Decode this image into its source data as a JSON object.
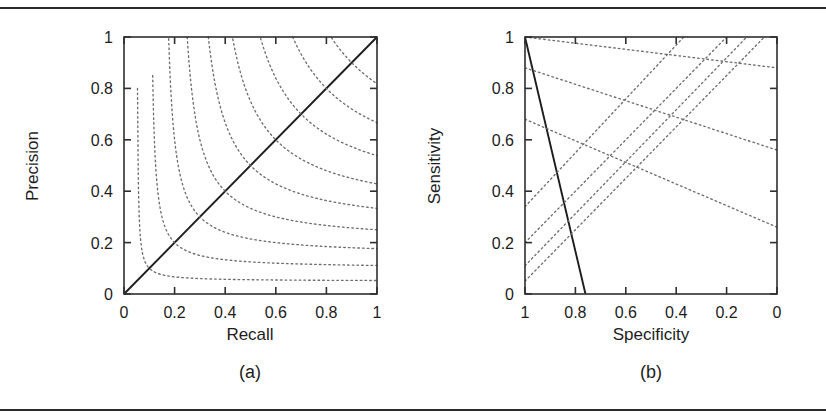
{
  "figure": {
    "background": "#ffffff",
    "rule_color": "#2b2b2b",
    "axis_color": "#2f2f2f",
    "iso_color": "#6e6e6e",
    "solid_color": "#1d1d1d"
  },
  "panels": [
    {
      "id": "a",
      "caption": "(a)",
      "xlabel": "Recall",
      "ylabel": "Precision",
      "xticks": [
        "0",
        "0.2",
        "0.4",
        "0.6",
        "0.8",
        "1"
      ],
      "yticks": [
        "0",
        "0.2",
        "0.4",
        "0.6",
        "0.8",
        "1"
      ]
    },
    {
      "id": "b",
      "caption": "(b)",
      "xlabel": "Specificity",
      "ylabel": "Sensitivity",
      "xticks": [
        "1",
        "0.8",
        "0.6",
        "0.4",
        "0.2",
        "0"
      ],
      "yticks": [
        "0",
        "0.2",
        "0.4",
        "0.6",
        "0.8",
        "1"
      ]
    }
  ],
  "chart_data": [
    {
      "type": "line",
      "panel": "a",
      "title": "(a)",
      "xlabel": "Recall",
      "ylabel": "Precision",
      "xlim": [
        0,
        1
      ],
      "ylim": [
        0,
        1
      ],
      "x_tick_values": [
        0,
        0.2,
        0.4,
        0.6,
        0.8,
        1
      ],
      "y_tick_values": [
        0,
        0.2,
        0.4,
        0.6,
        0.8,
        1
      ],
      "x_reversed": false,
      "grid": false,
      "legend": "none",
      "annotation": "Dotted curves are iso-F-measure contours F = 2PR/(P+R); solid line is the diagonal Precision = Recall.",
      "series": [
        {
          "name": "diagonal Precision = Recall",
          "style": "solid",
          "x": [
            0,
            1
          ],
          "values": [
            0,
            1
          ]
        },
        {
          "name": "iso-F 0.1",
          "style": "dotted",
          "level": 0.1
        },
        {
          "name": "iso-F 0.2",
          "style": "dotted",
          "level": 0.2
        },
        {
          "name": "iso-F 0.3",
          "style": "dotted",
          "level": 0.3
        },
        {
          "name": "iso-F 0.4",
          "style": "dotted",
          "level": 0.4
        },
        {
          "name": "iso-F 0.5",
          "style": "dotted",
          "level": 0.5
        },
        {
          "name": "iso-F 0.6",
          "style": "dotted",
          "level": 0.6
        },
        {
          "name": "iso-F 0.7",
          "style": "dotted",
          "level": 0.7
        },
        {
          "name": "iso-F 0.8",
          "style": "dotted",
          "level": 0.8
        },
        {
          "name": "iso-F 0.9",
          "style": "dotted",
          "level": 0.9
        }
      ]
    },
    {
      "type": "line",
      "panel": "b",
      "title": "(b)",
      "xlabel": "Specificity",
      "ylabel": "Sensitivity",
      "xlim": [
        1,
        0
      ],
      "ylim": [
        0,
        1
      ],
      "x_tick_values": [
        1,
        0.8,
        0.6,
        0.4,
        0.2,
        0
      ],
      "y_tick_values": [
        0,
        0.2,
        0.4,
        0.6,
        0.8,
        1
      ],
      "x_reversed": true,
      "grid": false,
      "legend": "none",
      "annotation": "Dotted straight lines are iso-performance lines fanning out from the top-left corner (Specificity = 1, Sensitivity = 1); the solid line descends from (1, 1) to about (0.76, 0).",
      "series": [
        {
          "name": "solid operating line",
          "style": "solid",
          "x": [
            1,
            0.76
          ],
          "values": [
            1,
            0
          ]
        },
        {
          "name": "iso line 1",
          "style": "dotted",
          "x": [
            1,
            0
          ],
          "values": [
            1.0,
            0.88
          ]
        },
        {
          "name": "iso line 2",
          "style": "dotted",
          "x": [
            1,
            0
          ],
          "values": [
            0.88,
            0.56
          ]
        },
        {
          "name": "iso line 3",
          "style": "dotted",
          "x": [
            1,
            0
          ],
          "values": [
            0.68,
            0.26
          ]
        },
        {
          "name": "iso line 4",
          "style": "dotted",
          "x": [
            1,
            0.37
          ],
          "values": [
            0.34,
            1.0
          ]
        },
        {
          "name": "iso line 5",
          "style": "dotted",
          "x": [
            1,
            0.2
          ],
          "values": [
            0.2,
            1.0
          ]
        },
        {
          "name": "iso line 6",
          "style": "dotted",
          "x": [
            1,
            0.12
          ],
          "values": [
            0.11,
            1.0
          ]
        },
        {
          "name": "iso line 7",
          "style": "dotted",
          "x": [
            1,
            0.05
          ],
          "values": [
            0.05,
            1.0
          ]
        }
      ]
    }
  ]
}
